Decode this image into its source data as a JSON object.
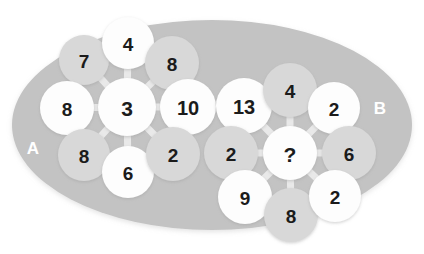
{
  "figure": {
    "type": "puzzle-diagram",
    "background_color": "#ffffff",
    "ellipse_color": "#c3c3c3",
    "node_light_color": "#fdfdfd",
    "node_dark_color": "#d8d8d8",
    "node_text_color": "#1b1b1b",
    "edge_color": "#e9e9e9",
    "cluster_label_color": "#ffffff"
  },
  "clusters": [
    {
      "id": "A",
      "label": "A",
      "label_x": 33,
      "label_y": 148,
      "center_node": "a-center",
      "nodes": [
        {
          "id": "a-nw",
          "value": "7",
          "x": 84,
          "y": 60,
          "r": 25,
          "shade": "dark",
          "font": 19
        },
        {
          "id": "a-n",
          "value": "4",
          "x": 128,
          "y": 43,
          "r": 26,
          "shade": "light",
          "font": 19
        },
        {
          "id": "a-ne",
          "value": "8",
          "x": 172,
          "y": 63,
          "r": 27,
          "shade": "dark",
          "font": 19
        },
        {
          "id": "a-w",
          "value": "8",
          "x": 67,
          "y": 108,
          "r": 27,
          "shade": "light",
          "font": 19
        },
        {
          "id": "a-center",
          "value": "3",
          "x": 127,
          "y": 107,
          "r": 29,
          "shade": "light",
          "font": 21
        },
        {
          "id": "a-e",
          "value": "10",
          "x": 188,
          "y": 107,
          "r": 28,
          "shade": "light",
          "font": 20
        },
        {
          "id": "a-sw",
          "value": "8",
          "x": 84,
          "y": 155,
          "r": 26,
          "shade": "dark",
          "font": 19
        },
        {
          "id": "a-s",
          "value": "6",
          "x": 128,
          "y": 172,
          "r": 26,
          "shade": "light",
          "font": 19
        },
        {
          "id": "a-se",
          "value": "2",
          "x": 173,
          "y": 154,
          "r": 27,
          "shade": "dark",
          "font": 19
        }
      ],
      "edges": [
        [
          "a-center",
          "a-nw"
        ],
        [
          "a-center",
          "a-n"
        ],
        [
          "a-center",
          "a-ne"
        ],
        [
          "a-center",
          "a-w"
        ],
        [
          "a-center",
          "a-e"
        ],
        [
          "a-center",
          "a-sw"
        ],
        [
          "a-center",
          "a-s"
        ],
        [
          "a-center",
          "a-se"
        ]
      ]
    },
    {
      "id": "B",
      "label": "B",
      "label_x": 380,
      "label_y": 108,
      "center_node": "b-center",
      "nodes": [
        {
          "id": "b-nw",
          "value": "13",
          "x": 244,
          "y": 106,
          "r": 28,
          "shade": "light",
          "font": 20
        },
        {
          "id": "b-n",
          "value": "4",
          "x": 290,
          "y": 90,
          "r": 27,
          "shade": "dark",
          "font": 19
        },
        {
          "id": "b-ne",
          "value": "2",
          "x": 334,
          "y": 108,
          "r": 26,
          "shade": "light",
          "font": 19
        },
        {
          "id": "b-w",
          "value": "2",
          "x": 231,
          "y": 153,
          "r": 27,
          "shade": "dark",
          "font": 19
        },
        {
          "id": "b-center",
          "value": "?",
          "x": 290,
          "y": 153,
          "r": 27,
          "shade": "light",
          "font": 21
        },
        {
          "id": "b-e",
          "value": "6",
          "x": 349,
          "y": 153,
          "r": 27,
          "shade": "dark",
          "font": 19
        },
        {
          "id": "b-sw",
          "value": "9",
          "x": 245,
          "y": 197,
          "r": 27,
          "shade": "light",
          "font": 19
        },
        {
          "id": "b-s",
          "value": "8",
          "x": 291,
          "y": 215,
          "r": 27,
          "shade": "dark",
          "font": 19
        },
        {
          "id": "b-se",
          "value": "2",
          "x": 335,
          "y": 196,
          "r": 26,
          "shade": "light",
          "font": 19
        }
      ],
      "edges": [
        [
          "b-center",
          "b-nw"
        ],
        [
          "b-center",
          "b-n"
        ],
        [
          "b-center",
          "b-ne"
        ],
        [
          "b-center",
          "b-w"
        ],
        [
          "b-center",
          "b-e"
        ],
        [
          "b-center",
          "b-sw"
        ],
        [
          "b-center",
          "b-s"
        ],
        [
          "b-center",
          "b-se"
        ]
      ]
    }
  ],
  "ellipse": {
    "cx": 212,
    "cy": 125,
    "rx": 200,
    "ry": 105
  }
}
